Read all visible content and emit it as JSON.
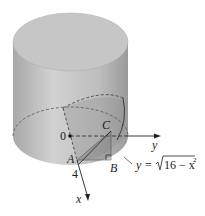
{
  "figure": {
    "colors": {
      "cylinder_side": "#b8b8b8",
      "cylinder_top": "#c4c4c4",
      "wedge": "#9c9c9c",
      "lines": "#333333"
    }
  },
  "labels": {
    "origin": "0",
    "point_a": "A",
    "point_b": "B",
    "point_c": "C",
    "radius_tick": "4",
    "x_axis": "x",
    "y_axis": "y",
    "curve_eq_lhs": "y = ",
    "curve_eq_radicand": "16 − x",
    "curve_eq_exp": "2"
  }
}
